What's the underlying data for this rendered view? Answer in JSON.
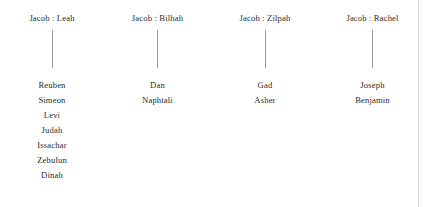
{
  "diagram": {
    "text_color": "#2b2b2b",
    "line_color": "#9a9a9a",
    "background_color": "#ffffff",
    "border_color": "#d8d8d8",
    "separator": " : ",
    "families": [
      {
        "parents": "Jacob : Leah",
        "father": "Jacob",
        "mother": "Leah",
        "children": [
          "Reuben",
          "Simeon",
          "Levi",
          "Judah",
          "Issachar",
          "Zebulun",
          "Dinah"
        ]
      },
      {
        "parents": "Jacob : Bilhah",
        "father": "Jacob",
        "mother": "Bilhah",
        "children": [
          "Dan",
          "Naphtali"
        ]
      },
      {
        "parents": "Jacob : Zilpah",
        "father": "Jacob",
        "mother": "Zilpah",
        "children": [
          "Gad",
          "Asher"
        ]
      },
      {
        "parents": "Jacob : Rachel",
        "father": "Jacob",
        "mother": "Rachel",
        "children": [
          "Joseph",
          "Benjamin"
        ]
      }
    ]
  }
}
